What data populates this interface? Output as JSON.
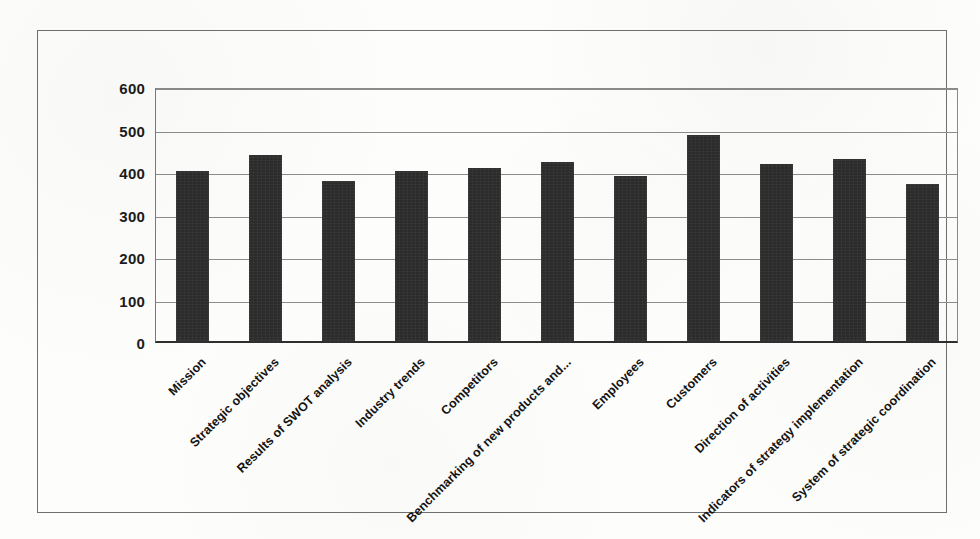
{
  "chart_data": {
    "type": "bar",
    "title": "",
    "subtitle": "",
    "xlabel": "",
    "ylabel": "",
    "ylim": [
      0,
      600
    ],
    "ytick_step": 100,
    "yticks": [
      600,
      500,
      400,
      300,
      200,
      100,
      0
    ],
    "grid": true,
    "legend": false,
    "legend_position": "none",
    "bar_color": "#2b2b2b",
    "categories": [
      "Mission",
      "Strategic objectives",
      "Results of SWOT analysis",
      "Industry trends",
      "Competitors",
      "Benchmarking of new products and...",
      "Employees",
      "Customers",
      "Direction of activities",
      "Indicators of strategy implementation",
      "System of strategic coordination"
    ],
    "values": [
      400,
      437,
      376,
      400,
      408,
      422,
      388,
      484,
      417,
      429,
      369
    ]
  },
  "colors": {
    "background": "#fdfdfb",
    "frame": "#6f6f6f",
    "gridline": "#8c8c8c",
    "axis": "#2f2f2f",
    "bar": "#2b2b2b",
    "text": "#141414"
  }
}
